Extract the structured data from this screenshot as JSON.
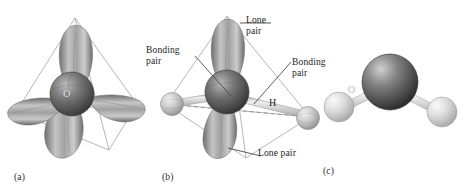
{
  "figure": {
    "background_color": "#ffffff",
    "panels": [
      {
        "id": "a",
        "caption": "(a)",
        "description": "Tetrahedral arrangement of four sp3 hybrid orbitals on oxygen",
        "center_atom_label": "O",
        "lobe_count": 4
      },
      {
        "id": "b",
        "caption": "(b)",
        "description": "Water molecule showing two bonding pairs to hydrogen and two lone pairs on oxygen",
        "center_atom_label": "O",
        "hydrogen_left_label": "H",
        "hydrogen_right_label": "H"
      },
      {
        "id": "c",
        "caption": "(c)",
        "description": "Ball and stick model of the bent water molecule"
      }
    ],
    "callouts": [
      {
        "id": "lone-pair-top",
        "text": "Lone\npair"
      },
      {
        "id": "bonding-pair-left",
        "text": "Bonding\npair"
      },
      {
        "id": "bonding-pair-right",
        "text": "Bonding\npair"
      },
      {
        "id": "lone-pair-bottom",
        "text": "Lone pair"
      }
    ],
    "colors": {
      "oxygen_sphere": "#5c5c5c",
      "hydrogen_sphere": "#c9c9c9",
      "orbital_lobe": "#9a9a9a",
      "wireframe": "#9e9e9e",
      "leader_line": "#4a4a4a",
      "dashed_line": "#8d8d8d",
      "text": "#1e1e1e"
    }
  }
}
